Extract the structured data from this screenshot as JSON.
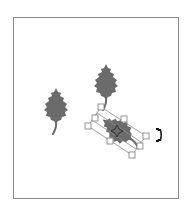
{
  "canvas": {
    "frame_color": "#8a8a8a",
    "background": "#ffffff"
  },
  "shapes": [
    {
      "name": "holly-leaf",
      "id": "leaf-1",
      "fill": "#6b6b6b",
      "cx": 56,
      "cy": 108,
      "rotation": 0,
      "selected": false
    },
    {
      "name": "holly-leaf",
      "id": "leaf-2",
      "fill": "#6b6b6b",
      "cx": 106,
      "cy": 84,
      "rotation": 0,
      "selected": false
    },
    {
      "name": "holly-leaf",
      "id": "leaf-3",
      "fill": "#6b6b6b",
      "cx": 119,
      "cy": 132,
      "rotation": -55,
      "selected": true
    }
  ],
  "selection": {
    "handle_count": 8,
    "handle_color": "#8a8a8a",
    "center_marker": "rotation-center"
  },
  "cursor": {
    "icon": "rotate-cursor-icon"
  }
}
